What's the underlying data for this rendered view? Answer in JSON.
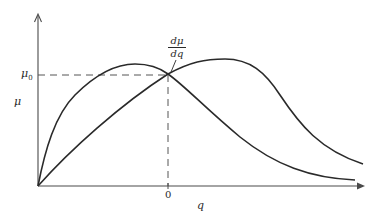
{
  "figure": {
    "type": "diagram",
    "axes": {
      "y_label": "μ",
      "x_label": "q",
      "y_marker_label": "μ",
      "y_marker_subscript": "0",
      "x_marker_label": "0"
    },
    "annotation": {
      "numerator": "dμ",
      "denominator": "dq"
    },
    "colors": {
      "line": "#2a2a2a",
      "background": "#ffffff"
    },
    "curves": [
      {
        "name": "curve-early-peak",
        "description": "rises steeply from origin, peaks before q=0, decays to right"
      },
      {
        "name": "curve-late-peak",
        "description": "rises near-linearly from origin, peaks after q=0, decays to right"
      }
    ]
  }
}
